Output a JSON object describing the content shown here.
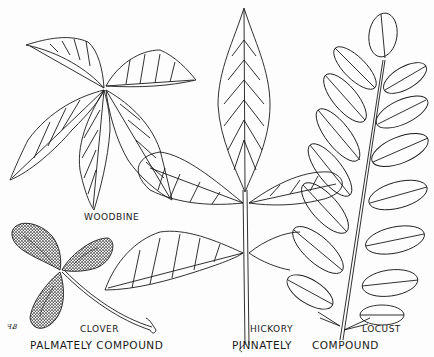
{
  "figure": {
    "labels": {
      "woodbine": "WOODBINE",
      "clover": "CLOVER",
      "hickory": "HICKORY",
      "locust": "LOCUST",
      "palmately_compound": "PALMATELY COMPOUND",
      "pinnately": "PINNATELY",
      "compound": "COMPOUND"
    },
    "signature": "ꟻᏰ",
    "colors": {
      "ink": "#1a1a1a",
      "paper": "#fdfdfd",
      "stipple": "#8a8a8a"
    }
  }
}
